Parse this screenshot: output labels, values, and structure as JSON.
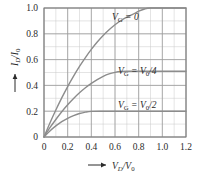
{
  "chart_data": {
    "type": "line",
    "title": "",
    "xlabel": "V_D/V_0",
    "ylabel": "I_D/I_0",
    "xlim": [
      0,
      1.2
    ],
    "ylim": [
      0,
      1.0
    ],
    "x_ticks": [
      0,
      0.2,
      0.4,
      0.6,
      0.8,
      1.0,
      1.2
    ],
    "y_ticks": [
      0,
      0.2,
      0.4,
      0.6,
      0.8,
      1.0
    ],
    "x_tick_labels": [
      "0",
      "0.2",
      "0.4",
      "0.6",
      "0.8",
      "1.0",
      "1.2"
    ],
    "y_tick_labels": [
      "0",
      "0.2",
      "0.4",
      "0.6",
      "0.8",
      "1.0"
    ],
    "grid": true,
    "grid_minor_step_x": 0.1,
    "grid_minor_step_y": 0.1,
    "legend_position": "inline-annotations",
    "series": [
      {
        "name": "V_G = 0",
        "saturation_current": 1.0,
        "saturation_voltage": 0.9,
        "points": [
          [
            0.0,
            0.0
          ],
          [
            0.05,
            0.108
          ],
          [
            0.1,
            0.209
          ],
          [
            0.15,
            0.303
          ],
          [
            0.2,
            0.391
          ],
          [
            0.25,
            0.472
          ],
          [
            0.3,
            0.547
          ],
          [
            0.35,
            0.616
          ],
          [
            0.4,
            0.679
          ],
          [
            0.45,
            0.736
          ],
          [
            0.5,
            0.787
          ],
          [
            0.55,
            0.831
          ],
          [
            0.6,
            0.87
          ],
          [
            0.65,
            0.903
          ],
          [
            0.7,
            0.929
          ],
          [
            0.75,
            0.95
          ],
          [
            0.8,
            0.975
          ],
          [
            0.85,
            0.992
          ],
          [
            0.9,
            1.0
          ],
          [
            1.0,
            1.0
          ],
          [
            1.1,
            1.0
          ],
          [
            1.2,
            1.0
          ]
        ]
      },
      {
        "name": "V_G = V_0/4",
        "saturation_current": 0.51,
        "saturation_voltage": 0.7,
        "points": [
          [
            0.0,
            0.0
          ],
          [
            0.05,
            0.072
          ],
          [
            0.1,
            0.136
          ],
          [
            0.15,
            0.196
          ],
          [
            0.2,
            0.25
          ],
          [
            0.25,
            0.299
          ],
          [
            0.3,
            0.343
          ],
          [
            0.35,
            0.382
          ],
          [
            0.4,
            0.416
          ],
          [
            0.45,
            0.445
          ],
          [
            0.5,
            0.47
          ],
          [
            0.55,
            0.489
          ],
          [
            0.6,
            0.501
          ],
          [
            0.65,
            0.508
          ],
          [
            0.7,
            0.51
          ],
          [
            0.8,
            0.51
          ],
          [
            0.9,
            0.51
          ],
          [
            1.0,
            0.51
          ],
          [
            1.1,
            0.51
          ],
          [
            1.2,
            0.51
          ]
        ]
      },
      {
        "name": "V_G = V_0/2",
        "saturation_current": 0.2,
        "saturation_voltage": 0.4,
        "points": [
          [
            0.0,
            0.0
          ],
          [
            0.05,
            0.047
          ],
          [
            0.1,
            0.086
          ],
          [
            0.15,
            0.119
          ],
          [
            0.2,
            0.145
          ],
          [
            0.25,
            0.166
          ],
          [
            0.3,
            0.182
          ],
          [
            0.35,
            0.193
          ],
          [
            0.4,
            0.199
          ],
          [
            0.5,
            0.2
          ],
          [
            0.6,
            0.2
          ],
          [
            0.7,
            0.2
          ],
          [
            0.8,
            0.2
          ],
          [
            0.9,
            0.2
          ],
          [
            1.0,
            0.2
          ],
          [
            1.1,
            0.2
          ],
          [
            1.2,
            0.2
          ]
        ]
      }
    ]
  },
  "axes": {
    "y_label_main": "I",
    "y_label_sub1": "D",
    "y_label_slash": "/I",
    "y_label_sub2": "0",
    "x_label_main": "V",
    "x_label_sub1": "D",
    "x_label_slash": "/V",
    "x_label_sub2": "0",
    "x_arrow": "arrow-right-icon",
    "y_arrow": "arrow-up-icon"
  },
  "annotations": [
    {
      "id": "curve-label-vg-0",
      "prefix": "V",
      "sub": "G",
      "equals": " = 0",
      "x": 112,
      "y": 20
    },
    {
      "id": "curve-label-vg-v0-4",
      "prefix": "V",
      "sub": "G",
      "equals": " = V",
      "sub2": "0",
      "suffix": "/4",
      "x": 118,
      "y": 74
    },
    {
      "id": "curve-label-vg-v0-2",
      "prefix": "V",
      "sub": "G",
      "equals": " = V",
      "sub2": "0",
      "suffix": "/2",
      "x": 118,
      "y": 108
    }
  ],
  "colors": {
    "background": "#ffffff",
    "grid_major": "#9a9a9a",
    "grid_minor": "#c8c8c8",
    "frame": "#7a7a7a",
    "curve": "#8c8c8c",
    "text": "#2b2b2b"
  }
}
